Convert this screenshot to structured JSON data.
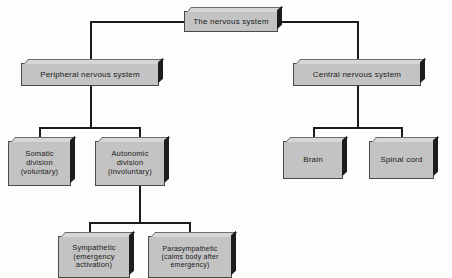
{
  "diagram": {
    "background_color": "#fdfdfb",
    "box_fill_color": "#c3c3c3",
    "box_top_face_color": "#d6d6d6",
    "box_side_face_color": "#1d1d1d",
    "line_color": "#1b1b1b",
    "text_color": "#1a1a1a"
  },
  "nodes": {
    "root": {
      "label": "The nervous system",
      "level": 0
    },
    "peripheral": {
      "label": "Peripheral nervous system",
      "level": 1
    },
    "central": {
      "label": "Central nervous system",
      "level": 1
    },
    "somatic": {
      "label": "Somatic\ndivision\n(voluntary)",
      "level": 2
    },
    "autonomic": {
      "label": "Autonomic\ndivision\n(involuntary)",
      "level": 2
    },
    "brain": {
      "label": "Brain",
      "level": 2
    },
    "spinal_cord": {
      "label": "Spinal cord",
      "level": 2
    },
    "sympathetic": {
      "label": "Sympathetic\n(emergency\nactivation)",
      "level": 3
    },
    "parasympathetic": {
      "label": "Parasympathetic\n(calms body after\nemergency)",
      "level": 3
    }
  },
  "edges": [
    {
      "from": "root",
      "to": "peripheral"
    },
    {
      "from": "root",
      "to": "central"
    },
    {
      "from": "peripheral",
      "to": "somatic"
    },
    {
      "from": "peripheral",
      "to": "autonomic"
    },
    {
      "from": "central",
      "to": "brain"
    },
    {
      "from": "central",
      "to": "spinal_cord"
    },
    {
      "from": "autonomic",
      "to": "sympathetic"
    },
    {
      "from": "autonomic",
      "to": "parasympathetic"
    }
  ]
}
